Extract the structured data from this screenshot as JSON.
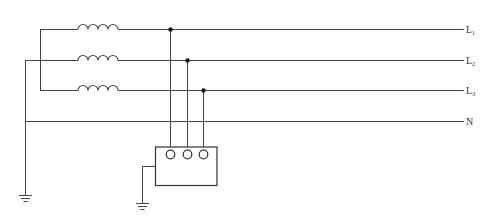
{
  "diagram": {
    "type": "electrical-schematic",
    "colors": {
      "line": "#444444",
      "background": "#ffffff",
      "dot": "#111111"
    },
    "lines": [
      {
        "id": "L1",
        "label": "L",
        "subscript": "1"
      },
      {
        "id": "L2",
        "label": "L",
        "subscript": "2"
      },
      {
        "id": "L3",
        "label": "L",
        "subscript": "3"
      },
      {
        "id": "N",
        "label": "N",
        "subscript": ""
      }
    ],
    "components": {
      "windings": 3,
      "device_terminals": 3,
      "ground_symbols": 2
    }
  }
}
